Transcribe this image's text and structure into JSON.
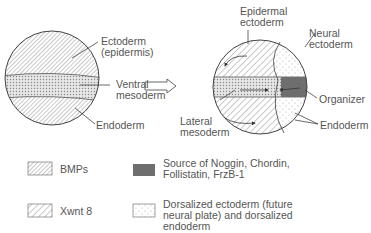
{
  "left_embryo": {
    "labels": {
      "ectoderm": "Ectoderm\n(epidermis)",
      "ventral_mesoderm": "Ventral\nmesoderm",
      "endoderm": "Endoderm"
    }
  },
  "right_embryo": {
    "labels": {
      "epidermal_ectoderm": "Epidermal\nectoderm",
      "neural_ectoderm": "Neural\nectoderm",
      "organizer": "Organizer",
      "lateral_mesoderm": "Lateral\nmesoderm",
      "endoderm": "Endoderm"
    }
  },
  "legend": [
    {
      "pattern": "diagonal-fine",
      "label": "BMPs"
    },
    {
      "pattern": "diagonal-wide",
      "label": "Xwnt 8"
    },
    {
      "pattern": "dark-solid",
      "label": "Source of Noggin, Chordin,\nFollistatin, FrzB-1"
    },
    {
      "pattern": "stipple",
      "label": "Dorsalized ectoderm (future\nneural plate) and dorsalized\nendoderm"
    }
  ],
  "colors": {
    "line": "#444444",
    "organizer": "#6e6e6e",
    "text": "#555555"
  }
}
